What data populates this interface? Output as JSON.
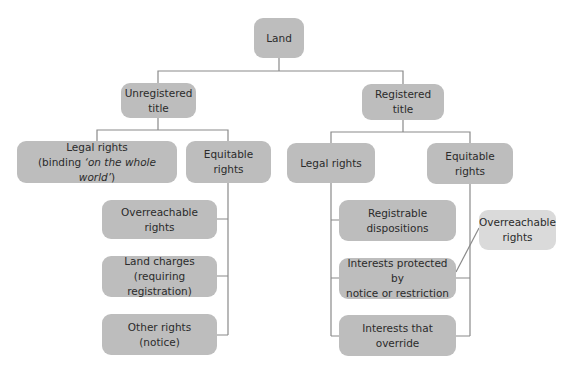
{
  "diagram": {
    "type": "tree",
    "colors": {
      "node_fill": "#bdbdbd",
      "node_fill_light": "#dadada",
      "connector": "#8a8a8a",
      "text": "#2b2b2b"
    },
    "root": {
      "label": "Land"
    },
    "unregistered": {
      "title": {
        "line1": "Unregistered",
        "line2": "title"
      },
      "legal": {
        "line1": "Legal rights",
        "line2_pre": "(binding ",
        "line2_em": "‘on the whole world’",
        "line2_post": ")"
      },
      "equitable": {
        "label": "Equitable rights"
      },
      "equitable_children": [
        {
          "line1": "Overreachable rights",
          "line2": ""
        },
        {
          "line1": "Land charges",
          "line2": "(requiring registration)"
        },
        {
          "line1": "Other rights (notice)",
          "line2": ""
        }
      ]
    },
    "registered": {
      "title": {
        "label": "Registered title"
      },
      "legal": {
        "label": "Legal rights"
      },
      "equitable": {
        "label": "Equitable rights"
      },
      "legal_children": [
        {
          "line1": "Registrable",
          "line2": "dispositions"
        },
        {
          "line1": "Interests protected by",
          "line2": "notice or restriction"
        },
        {
          "line1": "Interests that override",
          "line2": ""
        }
      ],
      "side_note": {
        "line1": "Overreachable",
        "line2": "rights"
      }
    }
  }
}
